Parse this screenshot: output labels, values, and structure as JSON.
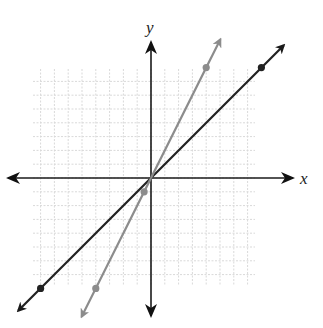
{
  "chart_data": {
    "type": "line",
    "title": "",
    "xlabel": "x",
    "ylabel": "y",
    "xlim": [
      -8,
      8
    ],
    "ylim": [
      -8,
      8
    ],
    "grid": true,
    "grid_step": 1,
    "series": [
      {
        "name": "dark line",
        "equation": "y = x",
        "color": "#222222",
        "points": [
          [
            -8,
            -8
          ],
          [
            0,
            0
          ],
          [
            8,
            8
          ]
        ],
        "marked_points": [
          [
            -8,
            -8
          ],
          [
            8,
            8
          ]
        ],
        "arrows": "both"
      },
      {
        "name": "gray line",
        "equation": "y = 2x",
        "color": "#8c8c8c",
        "points": [
          [
            -4,
            -8
          ],
          [
            0,
            0
          ],
          [
            4,
            8
          ]
        ],
        "marked_points": [
          [
            -4,
            -8
          ],
          [
            -0.5,
            -1
          ],
          [
            4,
            8
          ]
        ],
        "arrows": "both"
      }
    ]
  },
  "layout": {
    "origin_px": [
      151,
      178
    ],
    "cell_px": 13.8,
    "grid_px": {
      "left": 33,
      "right": 255,
      "top": 69,
      "bottom": 286
    },
    "x_axis_px": {
      "from": 8,
      "to": 293
    },
    "y_axis_px": {
      "from": 42,
      "to": 316
    },
    "colors": {
      "grid": "#d9d9d9",
      "axis": "#1a1a1a"
    }
  },
  "labels": {
    "x": "x",
    "y": "y"
  }
}
